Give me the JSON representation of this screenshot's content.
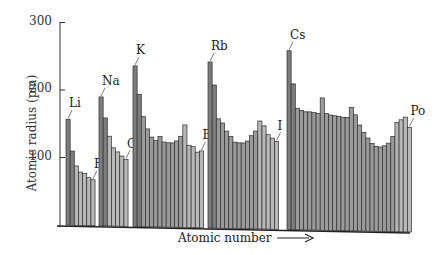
{
  "chart_data": {
    "type": "bar",
    "title": "",
    "xlabel": "Atomic number",
    "ylabel": "Atomic radius (pm)",
    "ylim": [
      0,
      300
    ],
    "yticks": [
      100,
      200,
      300
    ],
    "grid": false,
    "legend": null,
    "colors": {
      "s_block": "#7d7d7d",
      "d_block": "#9a9a9a",
      "p_block": "#b8b8b8",
      "outline": "#2e2e2e"
    },
    "periods": [
      {
        "elements": [
          "Li",
          "Be",
          "B",
          "C",
          "N",
          "O",
          "F"
        ],
        "values": [
          157,
          110,
          88,
          79,
          77,
          71,
          68
        ],
        "blocks": [
          "s",
          "s",
          "p",
          "p",
          "p",
          "p",
          "p"
        ]
      },
      {
        "elements": [
          "Na",
          "Mg",
          "Al",
          "Si",
          "P",
          "S",
          "Cl"
        ],
        "values": [
          191,
          160,
          133,
          116,
          110,
          104,
          99
        ],
        "blocks": [
          "s",
          "s",
          "p",
          "p",
          "p",
          "p",
          "p"
        ]
      },
      {
        "elements": [
          "K",
          "Ca",
          "Sc",
          "Ti",
          "V",
          "Cr",
          "Mn",
          "Fe",
          "Co",
          "Ni",
          "Cu",
          "Zn",
          "Ga",
          "Ge",
          "As",
          "Se",
          "Br"
        ],
        "values": [
          238,
          196,
          163,
          145,
          133,
          128,
          134,
          126,
          125,
          125,
          128,
          135,
          152,
          122,
          120,
          112,
          114
        ],
        "blocks": [
          "s",
          "s",
          "d",
          "d",
          "d",
          "d",
          "d",
          "d",
          "d",
          "d",
          "d",
          "d",
          "p",
          "p",
          "p",
          "p",
          "p"
        ]
      },
      {
        "elements": [
          "Rb",
          "Sr",
          "Y",
          "Zr",
          "Nb",
          "Mo",
          "Tc",
          "Ru",
          "Rh",
          "Pd",
          "Ag",
          "Cd",
          "In",
          "Sn",
          "Sb",
          "Te",
          "I"
        ],
        "values": [
          246,
          212,
          162,
          156,
          144,
          136,
          128,
          127,
          127,
          130,
          138,
          145,
          160,
          153,
          140,
          135,
          130
        ],
        "blocks": [
          "s",
          "s",
          "d",
          "d",
          "d",
          "d",
          "d",
          "d",
          "d",
          "d",
          "d",
          "d",
          "p",
          "p",
          "p",
          "p",
          "p"
        ]
      },
      {
        "elements": [
          "Cs",
          "Ba",
          "La",
          "Ce",
          "Pr",
          "Nd",
          "Pm",
          "Sm",
          "Eu",
          "Gd",
          "Tb",
          "Dy",
          "Ho",
          "Er",
          "Tm",
          "Yb",
          "Lu",
          "Hf",
          "Ta",
          "W",
          "Re",
          "Os",
          "Ir",
          "Pt",
          "Au",
          "Hg",
          "Tl",
          "Pb",
          "Bi",
          "Po"
        ],
        "values": [
          265,
          216,
          180,
          177,
          175,
          175,
          174,
          173,
          196,
          173,
          171,
          170,
          169,
          168,
          168,
          183,
          172,
          157,
          146,
          138,
          130,
          126,
          125,
          127,
          131,
          141,
          162,
          166,
          170,
          155
        ],
        "blocks": [
          "s",
          "s",
          "d",
          "f",
          "f",
          "f",
          "f",
          "f",
          "f",
          "f",
          "f",
          "f",
          "f",
          "f",
          "f",
          "f",
          "d",
          "d",
          "d",
          "d",
          "d",
          "d",
          "d",
          "d",
          "d",
          "d",
          "p",
          "p",
          "p",
          "p"
        ]
      }
    ],
    "annotations": [
      "Li",
      "F",
      "Na",
      "Cl",
      "K",
      "Br",
      "Rb",
      "I",
      "Cs",
      "Po"
    ]
  },
  "axis": {
    "ylabel": "Atomic radius (pm)",
    "xlabel": "Atomic number",
    "xlabel_arrow": "→",
    "ticks": [
      "100",
      "200",
      "300"
    ]
  }
}
